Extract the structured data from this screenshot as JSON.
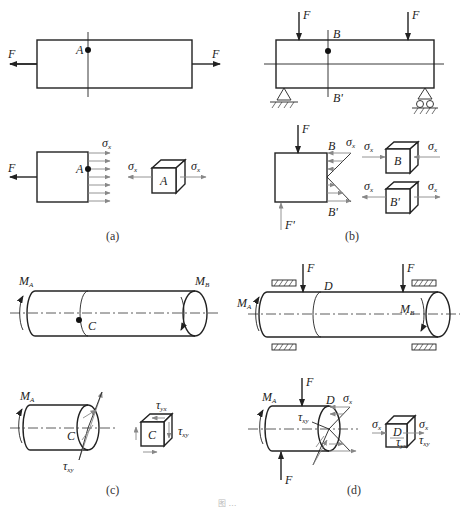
{
  "figure": {
    "caption": "图 …",
    "panels": [
      {
        "id": "a",
        "label": "(a)",
        "description": "Axial tension bar",
        "force_label": "F",
        "point_label": "A",
        "stress_label": "σ",
        "stress_sub": "x"
      },
      {
        "id": "b",
        "label": "(b)",
        "description": "Simply supported beam in bending",
        "force_label": "F",
        "reaction_label": "F'",
        "point_top": "B",
        "point_bottom": "B'",
        "stress_label": "σ",
        "stress_sub": "x"
      },
      {
        "id": "c",
        "label": "(c)",
        "description": "Shaft in torsion",
        "moment_a": "M",
        "moment_a_sub": "A",
        "moment_b": "M",
        "moment_b_sub": "B",
        "point_label": "C",
        "shear_label": "τ",
        "shear_xy_sub": "xy",
        "shear_yx_sub": "yx"
      },
      {
        "id": "d",
        "label": "(d)",
        "description": "Shaft in combined bending and torsion",
        "force_label": "F",
        "moment_a": "M",
        "moment_a_sub": "A",
        "moment_b": "M",
        "moment_b_sub": "B",
        "point_label": "D",
        "stress_label": "σ",
        "stress_sub": "x",
        "shear_label": "τ",
        "shear_xy_sub": "xy",
        "shear_yx_sub": "yx"
      }
    ]
  }
}
